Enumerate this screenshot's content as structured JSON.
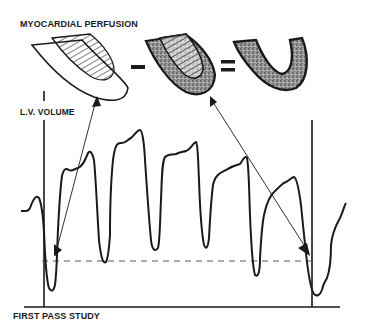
{
  "diagram": {
    "title": "MYOCARDIAL PERFUSION",
    "y_axis_label": "L.V. VOLUME",
    "x_axis_label": "FIRST PASS STUDY",
    "equation": {
      "terms": [
        {
          "id": "end-diastolic-shape",
          "fill": "hatched blood pool inside outline"
        },
        {
          "id": "operator-minus",
          "symbol": "−"
        },
        {
          "id": "combined-shape",
          "fill": "hatched blood pool with stippled myocardium"
        },
        {
          "id": "operator-equals",
          "symbol": "="
        },
        {
          "id": "myocardium-shape",
          "fill": "stippled myocardium only"
        }
      ]
    },
    "annotations": {
      "left_arrow": "from first end-diastolic frame to first shape",
      "right_arrow": "from last frame to combined shape",
      "reference_line": "dashed horizontal line at common volume level"
    },
    "colors": {
      "ink": "#1a1a1a",
      "background": "#ffffff",
      "dash": "#555555"
    }
  }
}
